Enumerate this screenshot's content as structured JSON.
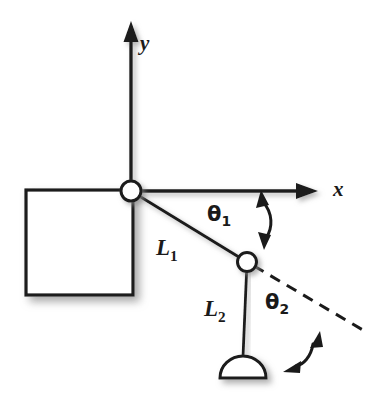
{
  "figure": {
    "background_color": "#ffffff",
    "ink_color": "#1a1a1a",
    "shadow_color": "#9a9a9a"
  },
  "axes": {
    "x_label": "x",
    "y_label": "y",
    "origin": {
      "x": 131,
      "y": 191
    },
    "x_axis": {
      "from": {
        "x": 131,
        "y": 191
      },
      "to": {
        "x": 316,
        "y": 191
      },
      "arrow": "end"
    },
    "y_axis": {
      "from": {
        "x": 131,
        "y": 191
      },
      "to": {
        "x": 131,
        "y": 24
      },
      "arrow": "end"
    },
    "x_label_pos": {
      "x": 333,
      "y": 180
    },
    "y_label_pos": {
      "x": 139,
      "y": 36
    }
  },
  "base": {
    "name": "fixed base block",
    "shape": "square",
    "x": 26,
    "y": 190,
    "width": 107,
    "height": 105,
    "fill": "#ffffff",
    "stroke": "#1a1a1a"
  },
  "joints": [
    {
      "name": "shoulder-joint",
      "cx": 131,
      "cy": 191,
      "r": 10,
      "fill": "#ffffff"
    },
    {
      "name": "elbow-joint",
      "cx": 247,
      "cy": 262,
      "r": 9.5,
      "fill": "#ffffff"
    }
  ],
  "links": [
    {
      "name": "link-1",
      "label": "L",
      "subscript": "1",
      "from": {
        "x": 131,
        "y": 191
      },
      "to": {
        "x": 247,
        "y": 262
      },
      "label_pos": {
        "x": 155,
        "y": 238
      }
    },
    {
      "name": "link-2",
      "label": "L",
      "subscript": "2",
      "from": {
        "x": 247,
        "y": 262
      },
      "to": {
        "x": 243,
        "y": 356
      },
      "label_pos": {
        "x": 203,
        "y": 298
      }
    }
  ],
  "end_effector": {
    "name": "end-effector-gripper",
    "shape": "semicircle-dome",
    "cx": 243,
    "cy": 378,
    "rx": 23,
    "ry": 22,
    "fill": "#ffffff"
  },
  "dashed_reference_line": {
    "name": "link-1-extension",
    "from": {
      "x": 253,
      "y": 266
    },
    "to": {
      "x": 368,
      "y": 333
    },
    "dash": "10 7"
  },
  "angles": [
    {
      "name": "theta-1",
      "label": "θ",
      "subscript": "1",
      "label_pos": {
        "x": 206,
        "y": 203
      },
      "arc": {
        "start": {
          "x": 262,
          "y": 197
        },
        "end": {
          "x": 266,
          "y": 242
        },
        "bow": 14
      },
      "arrows": "both"
    },
    {
      "name": "theta-2",
      "label": "θ",
      "subscript": "2",
      "label_pos": {
        "x": 264,
        "y": 291
      },
      "arc": {
        "start": {
          "x": 316,
          "y": 339
        },
        "end": {
          "x": 294,
          "y": 367
        },
        "bow": 12
      },
      "arrows": "both"
    }
  ]
}
